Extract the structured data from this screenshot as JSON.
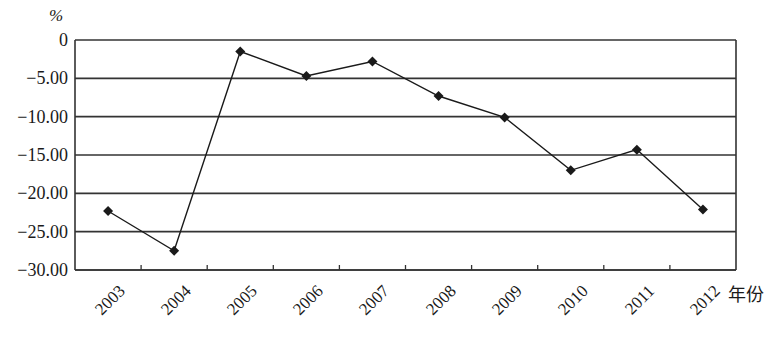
{
  "chart_data": {
    "type": "line",
    "title": "",
    "xlabel": "年份",
    "ylabel": "%",
    "categories": [
      "2003",
      "2004",
      "2005",
      "2006",
      "2007",
      "2008",
      "2009",
      "2010",
      "2011",
      "2012"
    ],
    "series": [
      {
        "name": "growth",
        "marker": "diamond",
        "color": "#1a1a1a",
        "values": [
          -22.3,
          -27.5,
          -1.5,
          -4.7,
          -2.8,
          -7.3,
          -10.1,
          -17.0,
          -14.3,
          -22.1
        ]
      }
    ],
    "ylim": [
      -30,
      0
    ],
    "yticks": [
      0,
      -5,
      -10,
      -15,
      -20,
      -25,
      -30
    ],
    "ytick_labels": [
      "0",
      "-5.00",
      "-10.00",
      "-15.00",
      "-20.00",
      "-25.00",
      "-30.00"
    ],
    "grid": {
      "horizontal": true,
      "vertical": false
    },
    "legend": null
  },
  "labels": {
    "y_unit": "%",
    "x_unit": "年份"
  },
  "colors": {
    "line": "#1a1a1a",
    "grid": "#333333",
    "axis": "#333333",
    "background": "#ffffff"
  }
}
